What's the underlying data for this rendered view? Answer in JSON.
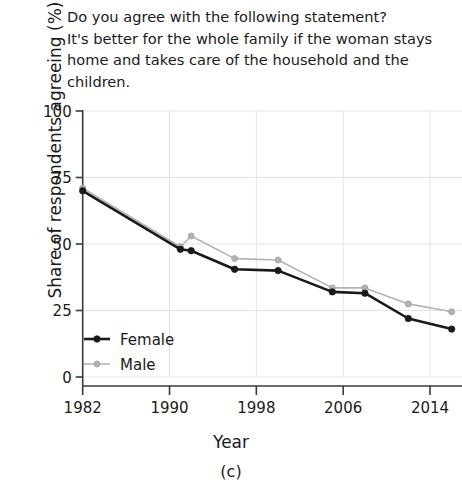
{
  "figure": {
    "question_title": "Do you agree with the following statement?\nIt's better for the whole family if the woman stays\nhome and takes care of the household and the\nchildren.",
    "subcaption": "(c)"
  },
  "chart_data": {
    "type": "line",
    "title": "Do you agree with the following statement? It's better for the whole family if the woman stays home and takes care of the household and the children.",
    "xlabel": "Year",
    "ylabel": "Share of respondents agreeing (%)",
    "xlim": [
      1980,
      2017
    ],
    "ylim": [
      0,
      100
    ],
    "xticks": [
      1982,
      1990,
      1998,
      2006,
      2014
    ],
    "yticks": [
      0,
      25,
      50,
      75,
      100
    ],
    "grid": true,
    "legend_position": "lower-left",
    "x": [
      1982,
      1991,
      1992,
      1996,
      2000,
      2005,
      2008,
      2012,
      2016
    ],
    "series": [
      {
        "name": "Female",
        "color": "#1a1a1a",
        "values": [
          70,
          48,
          47.5,
          40.5,
          40,
          32,
          31.5,
          22,
          18
        ]
      },
      {
        "name": "Male",
        "color": "#b3b3b3",
        "values": [
          71,
          49,
          53,
          44.5,
          44,
          33.5,
          33.5,
          27.5,
          24.5
        ]
      }
    ]
  }
}
